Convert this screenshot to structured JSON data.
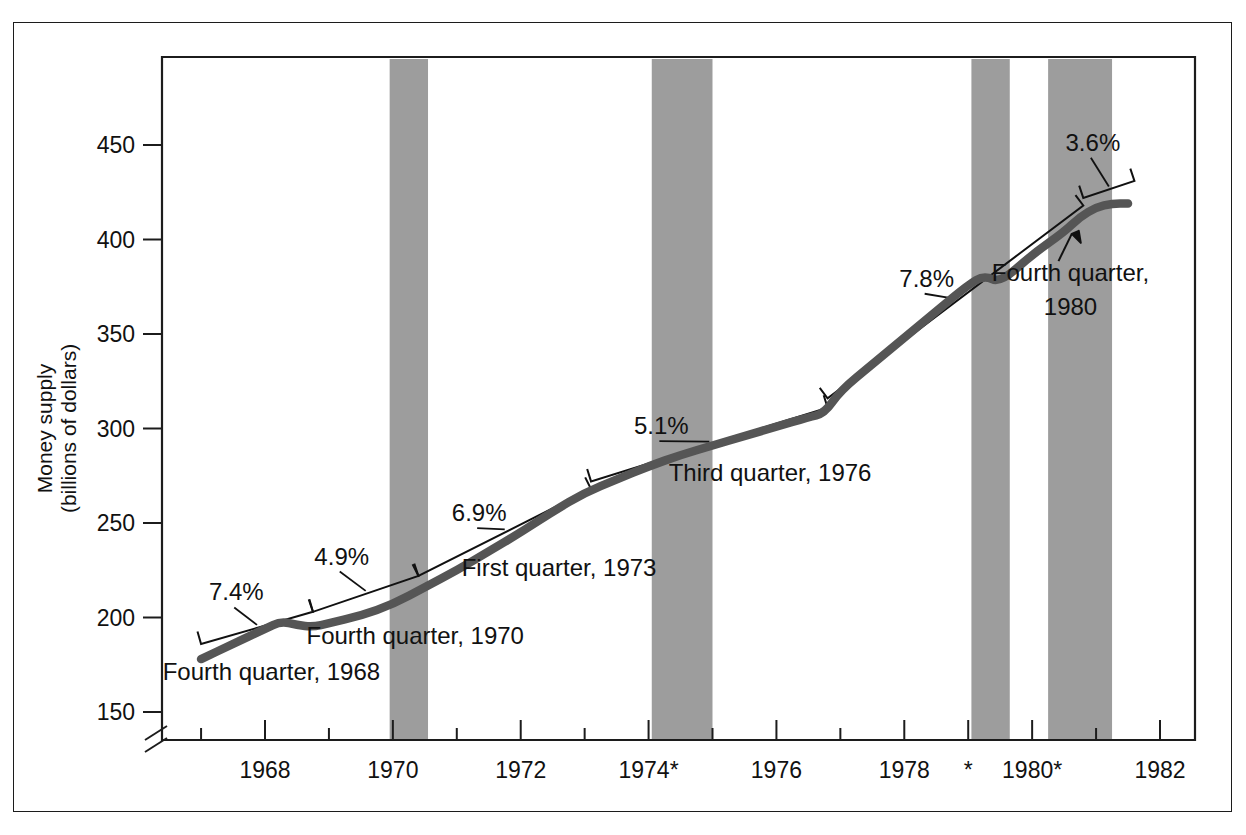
{
  "figure": {
    "frame_color": "#1c1c1c",
    "band_color": "#9d9d9d",
    "curve_color": "#555555",
    "trend_color": "#111111"
  },
  "chart_data": {
    "type": "line",
    "title": "",
    "xlabel": "",
    "ylabel": "Money supply\n(billions of dollars)",
    "ylabel_line1": "Money supply",
    "ylabel_line2": "(billions of dollars)",
    "ylim": [
      140,
      470
    ],
    "xlim": [
      1966.9,
      1982.1
    ],
    "yticks": [
      150,
      200,
      250,
      300,
      350,
      400,
      450
    ],
    "ytick_labels": [
      "150",
      "200",
      "250",
      "300",
      "350",
      "400",
      "450"
    ],
    "xticks": [
      1967,
      1968,
      1969,
      1970,
      1971,
      1972,
      1973,
      1974,
      1975,
      1976,
      1977,
      1978,
      1979,
      1980,
      1981,
      1982
    ],
    "xtick_labels": [
      "1968",
      "1970",
      "1972",
      "1974*",
      "1976",
      "1978",
      "*",
      "1980*",
      "1982"
    ],
    "xtick_label_years": [
      1968,
      1970,
      1972,
      1974,
      1976,
      1978,
      1979,
      1980,
      1982
    ],
    "axis_break": true,
    "grid": false,
    "legend": "none",
    "series": [
      {
        "name": "Money supply (M1)",
        "style": "thick-gray-curve",
        "x": [
          1967.0,
          1967.5,
          1968.0,
          1968.25,
          1968.5,
          1968.75,
          1969.0,
          1969.5,
          1970.0,
          1970.5,
          1971.0,
          1971.5,
          1972.0,
          1972.5,
          1973.0,
          1973.5,
          1974.0,
          1974.5,
          1975.0,
          1975.5,
          1976.0,
          1976.5,
          1976.75,
          1977.0,
          1977.5,
          1978.0,
          1978.5,
          1979.0,
          1979.25,
          1979.5,
          1980.0,
          1980.5,
          1980.75,
          1981.0,
          1981.25,
          1981.5
        ],
        "y": [
          178,
          186,
          194,
          198,
          196,
          195,
          197,
          201,
          207,
          216,
          225,
          235,
          245,
          256,
          266,
          273,
          280,
          286,
          291,
          296,
          301,
          306,
          308,
          320,
          334,
          348,
          362,
          376,
          381,
          377,
          392,
          404,
          412,
          417,
          419,
          419
        ]
      },
      {
        "name": "Trend lines (growth-rate segments)",
        "style": "thin-black-brackets",
        "segments": [
          {
            "label": "7.4%",
            "x_start": 1967.0,
            "x_end": 1968.75,
            "y_start": 186,
            "y_end": 203
          },
          {
            "label": "4.9%",
            "x_start": 1968.75,
            "x_end": 1970.4,
            "y_start": 203,
            "y_end": 222
          },
          {
            "label": "6.9%",
            "x_start": 1970.4,
            "x_end": 1973.1,
            "y_start": 222,
            "y_end": 268
          },
          {
            "label": "5.1%",
            "x_start": 1973.1,
            "x_end": 1976.8,
            "y_start": 272,
            "y_end": 311
          },
          {
            "label": "7.8%",
            "x_start": 1976.8,
            "x_end": 1980.8,
            "y_start": 316,
            "y_end": 418
          },
          {
            "label": "3.6%",
            "x_start": 1980.8,
            "x_end": 1981.6,
            "y_start": 422,
            "y_end": 431
          }
        ]
      }
    ],
    "growth_rate_labels": [
      {
        "text": "7.4%",
        "x": 1967.55,
        "y": 209
      },
      {
        "text": "4.9%",
        "x": 1969.2,
        "y": 228
      },
      {
        "text": "6.9%",
        "x": 1971.35,
        "y": 251
      },
      {
        "text": "5.1%",
        "x": 1974.2,
        "y": 297
      },
      {
        "text": "7.8%",
        "x": 1978.35,
        "y": 375
      },
      {
        "text": "3.6%",
        "x": 1980.95,
        "y": 447
      }
    ],
    "annotations": [
      {
        "text": "Fourth quarter, 1968",
        "x": 1968.1,
        "y": 167,
        "arrow": false
      },
      {
        "text": "Fourth quarter, 1970",
        "x": 1970.35,
        "y": 186,
        "arrow": false
      },
      {
        "text": "First quarter, 1973",
        "x": 1972.6,
        "y": 222,
        "arrow": false
      },
      {
        "text": "Third quarter, 1976",
        "x": 1975.9,
        "y": 272,
        "arrow": false
      },
      {
        "text": "Fourth quarter,",
        "x": 1980.6,
        "y": 378,
        "arrow": true
      },
      {
        "text": "1980",
        "x": 1980.6,
        "y": 360,
        "arrow": false
      }
    ],
    "recession_bands": [
      {
        "start": 1969.95,
        "end": 1970.55
      },
      {
        "start": 1974.05,
        "end": 1975.0
      },
      {
        "start": 1979.05,
        "end": 1979.65
      },
      {
        "start": 1980.25,
        "end": 1981.25
      }
    ]
  }
}
